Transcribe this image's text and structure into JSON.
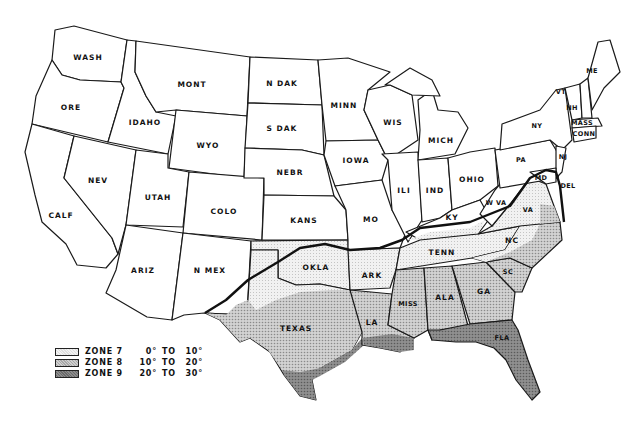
{
  "map": {
    "title": "",
    "states": {
      "wash": "WASH",
      "ore": "ORE",
      "calf": "CALF",
      "idaho": "IDAHO",
      "nev": "NEV",
      "mont": "MONT",
      "wyo": "WYO",
      "utah": "UTAH",
      "ariz": "ARIZ",
      "colo": "COLO",
      "nmex": "N MEX",
      "ndak": "N DAK",
      "sdak": "S DAK",
      "nebr": "NEBR",
      "kans": "KANS",
      "okla": "OKLA",
      "texas": "TEXAS",
      "minn": "MINN",
      "iowa": "IOWA",
      "mo": "MO",
      "ark": "ARK",
      "la": "LA",
      "wis": "WIS",
      "ili": "ILI",
      "mich": "MICH",
      "ind": "IND",
      "ohio": "OHIO",
      "ky": "KY",
      "tenn": "TENN",
      "miss": "MISS",
      "ala": "ALA",
      "ga": "GA",
      "fla": "FLA",
      "sc": "SC",
      "nc": "NC",
      "va": "VA",
      "wva": "W VA",
      "pa": "PA",
      "ny": "NY",
      "nj": "NJ",
      "md": "MD",
      "del": "DEL",
      "vt": "VT",
      "nh": "NH",
      "me": "ME",
      "mass": "MASS",
      "conn": "CONN"
    },
    "colors": {
      "zone7": "#e6e6e6",
      "zone8": "#bdbdbd",
      "zone9": "#7d7d7d",
      "outline": "#1a1a1a"
    }
  },
  "legend": {
    "items": [
      {
        "zone": "ZONE 7",
        "from": "0°",
        "to_word": "TO",
        "to": "10°"
      },
      {
        "zone": "ZONE 8",
        "from": "10°",
        "to_word": "TO",
        "to": "20°"
      },
      {
        "zone": "ZONE 9",
        "from": "20°",
        "to_word": "TO",
        "to": "30°"
      }
    ]
  }
}
